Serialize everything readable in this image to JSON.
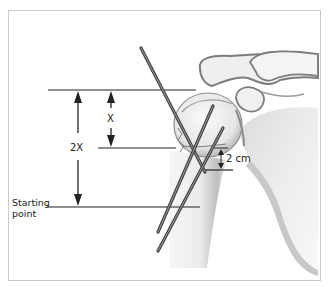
{
  "figure": {
    "labels": {
      "x": "X",
      "two_x": "2X",
      "starting_point_line1": "Starting",
      "starting_point_line2": "point",
      "two_cm": "2 cm"
    },
    "colors": {
      "frame_border": "#c9c9c9",
      "line": "#222222",
      "pin": "#555555",
      "bone_fill": "#f2f2f2",
      "bone_shadow": "#8a8a8a"
    },
    "structures": [
      "humeral-head",
      "humeral-shaft",
      "scapula",
      "acromion",
      "clavicle",
      "coracoid",
      "fracture-line"
    ],
    "pins": [
      {
        "name": "pin-1",
        "from": [
          141,
          48
        ],
        "to": [
          205,
          172
        ]
      },
      {
        "name": "pin-2",
        "from": [
          213,
          106
        ],
        "to": [
          158,
          232
        ]
      },
      {
        "name": "pin-3",
        "from": [
          223,
          128
        ],
        "to": [
          158,
          250
        ]
      }
    ],
    "measurements": [
      {
        "name": "reference-line-top",
        "y": 90
      },
      {
        "name": "reference-line-mid",
        "y": 148
      },
      {
        "name": "reference-line-starting",
        "y": 207
      },
      {
        "name": "reference-line-2cm",
        "y": 170
      }
    ]
  }
}
